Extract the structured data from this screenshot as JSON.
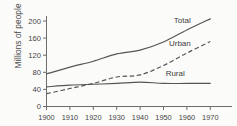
{
  "chart_data": {
    "type": "line",
    "title": "",
    "xlabel": "",
    "ylabel": "Millions of people",
    "xlim": [
      1900,
      1970
    ],
    "ylim": [
      0,
      220
    ],
    "xticks": [
      1900,
      1910,
      1920,
      1930,
      1940,
      1950,
      1960,
      1970
    ],
    "yticks": [
      0,
      40,
      80,
      120,
      160,
      200
    ],
    "xtick_labels": [
      "1900",
      "1910",
      "1920",
      "1930",
      "1940",
      "1950",
      "1960",
      "1970"
    ],
    "ytick_labels": [
      "0",
      "40",
      "80",
      "120",
      "160",
      "200"
    ],
    "grid": false,
    "legend_position": "inline-end-labels",
    "x": [
      1900,
      1910,
      1920,
      1930,
      1940,
      1950,
      1960,
      1970
    ],
    "series": [
      {
        "name": "Total",
        "label": "Total",
        "style": "solid",
        "color": "#555555",
        "values": [
          76,
          92,
          106,
          123,
          132,
          151,
          179,
          205
        ]
      },
      {
        "name": "Urban",
        "label": "Urban",
        "style": "dashed",
        "color": "#555555",
        "values": [
          30,
          42,
          54,
          69,
          74,
          96,
          125,
          152
        ]
      },
      {
        "name": "Rural",
        "label": "Rural",
        "style": "solid",
        "color": "#555555",
        "values": [
          46,
          50,
          52,
          54,
          57,
          54,
          54,
          54
        ]
      }
    ],
    "annotations": [
      {
        "text": "Total",
        "x": 1958,
        "y": 196
      },
      {
        "text": "Urban",
        "x": 1957,
        "y": 142
      },
      {
        "text": "Rural",
        "x": 1955,
        "y": 72
      }
    ]
  },
  "axis": {
    "y_title": "Millions of people"
  }
}
